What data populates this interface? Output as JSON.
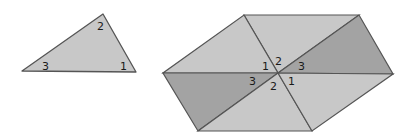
{
  "colors": {
    "light": "#c8c8c8",
    "dark": "#a3a3a3",
    "stroke": "#555555",
    "text": "#1a1a1a"
  },
  "triangle": {
    "labels": [
      {
        "text": "2",
        "x": 97,
        "y": 30
      },
      {
        "text": "3",
        "x": 42,
        "y": 70
      },
      {
        "text": "1",
        "x": 120,
        "y": 70
      }
    ]
  },
  "hexagon": {
    "labels": [
      {
        "text": "1",
        "x": 262,
        "y": 70
      },
      {
        "text": "2",
        "x": 275,
        "y": 65
      },
      {
        "text": "3",
        "x": 298,
        "y": 70
      },
      {
        "text": "3",
        "x": 249,
        "y": 85
      },
      {
        "text": "2",
        "x": 270,
        "y": 90
      },
      {
        "text": "1",
        "x": 288,
        "y": 85
      }
    ]
  }
}
